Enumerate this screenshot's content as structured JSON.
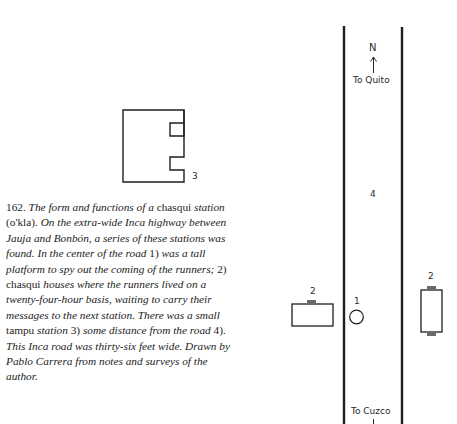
{
  "figure": {
    "number": "162.",
    "caption_segments": [
      {
        "text": "The form and functions of a ",
        "style": "italic"
      },
      {
        "text": "chasqui",
        "style": "roman"
      },
      {
        "text": " station ",
        "style": "italic"
      },
      {
        "text": "(o'kla). ",
        "style": "roman"
      },
      {
        "text": "On the extra-wide Inca highway between Jauja and Bonbón, a series of these stations was found. In the center of the road ",
        "style": "italic"
      },
      {
        "text": "1)",
        "style": "roman"
      },
      {
        "text": " was a tall platform to spy out the coming of the runners; ",
        "style": "italic"
      },
      {
        "text": "2) chasqui",
        "style": "roman"
      },
      {
        "text": " houses where the runners lived on a twenty-four-hour basis, waiting to carry their messages to the next station. There was a small ",
        "style": "italic"
      },
      {
        "text": "tampu",
        "style": "roman"
      },
      {
        "text": " station ",
        "style": "italic"
      },
      {
        "text": "3)",
        "style": "roman"
      },
      {
        "text": " some distance from the road ",
        "style": "italic"
      },
      {
        "text": "4).",
        "style": "roman"
      },
      {
        "text": " This Inca road was thirty-six feet wide. Drawn by Pablo Carrera from notes and surveys of the author.",
        "style": "italic"
      }
    ]
  },
  "diagram": {
    "north_label": "N",
    "top_destination": "To Quito",
    "bottom_destination": "To Cuzco",
    "labels": {
      "platform": "1",
      "house_left": "2",
      "house_right": "2",
      "tampu": "3",
      "road": "4"
    },
    "colors": {
      "ink": "#1e1e1e",
      "door": "#6a6a6a"
    }
  }
}
